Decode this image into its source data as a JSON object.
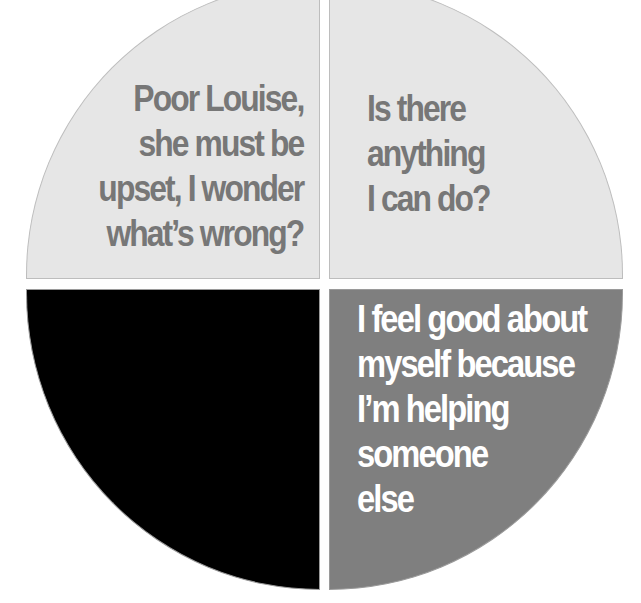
{
  "diagram": {
    "type": "quadrant-pie",
    "colors": {
      "top_left": "#e6e6e6",
      "top_right": "#e6e6e6",
      "bottom_left": "#000000",
      "bottom_right": "#7f7f7f",
      "text_on_light": "#777777",
      "text_on_dark": "#ffffff"
    },
    "quadrants": {
      "top_left": {
        "lines": [
          "Poor Louise,",
          "she must be",
          "upset, I wonder",
          "what’s wrong?"
        ]
      },
      "top_right": {
        "lines": [
          "Is there",
          "anything",
          "I can do?"
        ]
      },
      "bottom_left": {
        "lines": []
      },
      "bottom_right": {
        "lines": [
          "I feel good about",
          "myself because",
          "I’m helping",
          "someone",
          "else"
        ]
      }
    }
  }
}
